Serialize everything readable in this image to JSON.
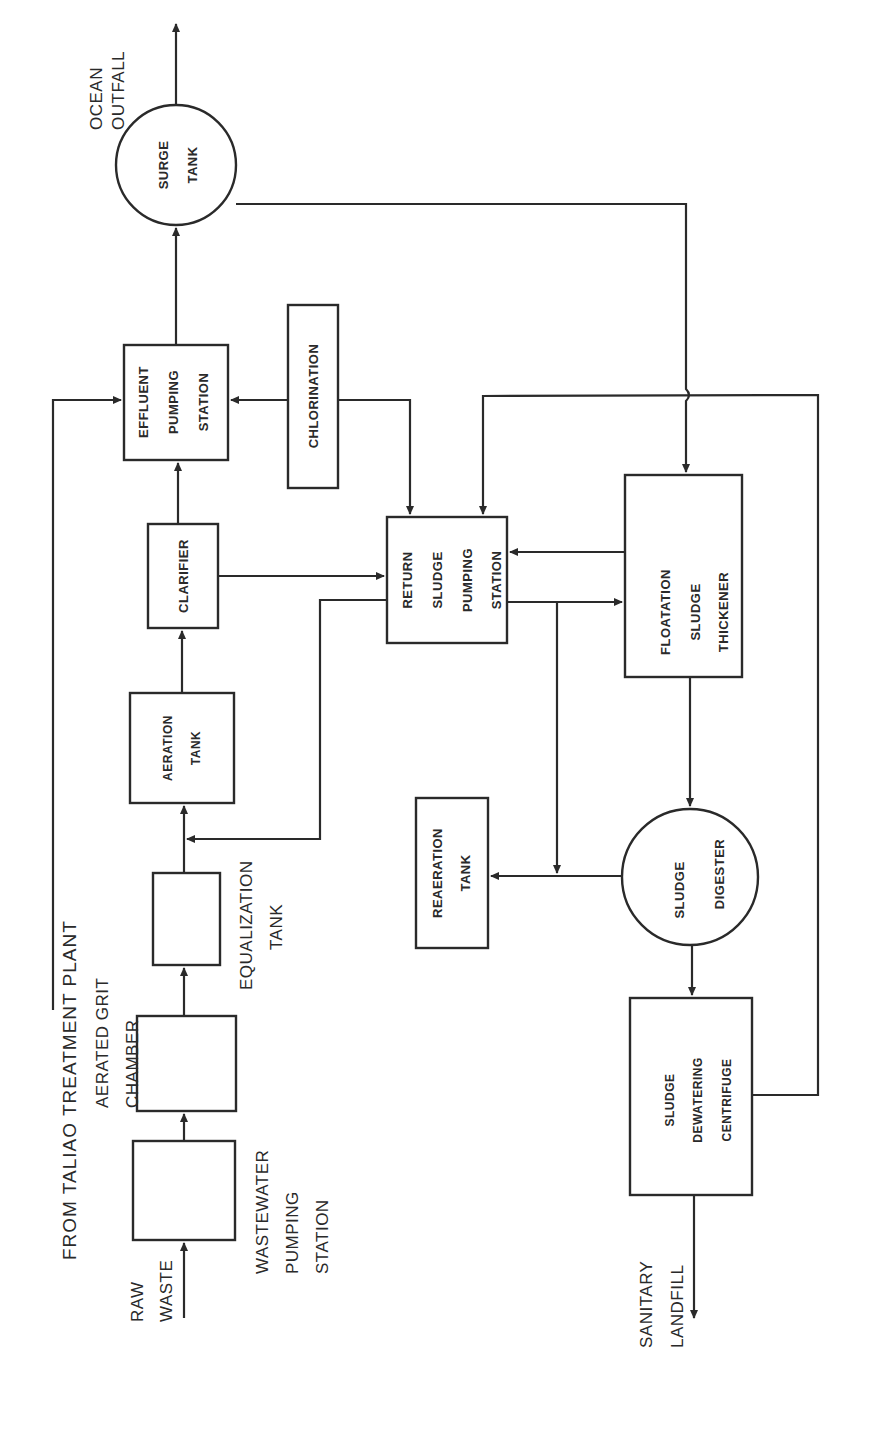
{
  "header": {
    "text": ""
  },
  "diagram": {
    "orientation": "rotated 90 degrees counter-clockwise",
    "colors": {
      "line": "#2a2a2a",
      "background": "#ffffff"
    },
    "external_labels": {
      "ocean_outfall": [
        "OCEAN",
        "OUTFALL"
      ],
      "from_taliao": "FROM TALIAO TREATMENT PLANT",
      "aerated_grit": [
        "AERATED GRIT",
        "CHAMBER"
      ],
      "equalization": [
        "EQUALIZATION",
        "TANK"
      ],
      "raw_waste": [
        "RAW",
        "WASTE"
      ],
      "ww_pumping": [
        "WASTEWATER",
        "PUMPING",
        "STATION"
      ],
      "sanitary_landfill": [
        "SANITARY",
        "LANDFILL"
      ]
    },
    "nodes": {
      "surge_tank": {
        "shape": "circle",
        "lines": [
          "SURGE",
          "TANK"
        ]
      },
      "effluent_pumping": {
        "shape": "box",
        "lines": [
          "EFFLUENT",
          "PUMPING",
          "STATION"
        ]
      },
      "chlorination": {
        "shape": "box",
        "lines": [
          "CHLORINATION"
        ]
      },
      "clarifier": {
        "shape": "box",
        "lines": [
          "CLARIFIER"
        ]
      },
      "aeration_tank": {
        "shape": "box",
        "lines": [
          "AERATION",
          "TANK"
        ]
      },
      "equalization_tank": {
        "shape": "box",
        "lines": []
      },
      "grit_chamber": {
        "shape": "box",
        "lines": []
      },
      "ww_pumping_station": {
        "shape": "box",
        "lines": []
      },
      "return_sludge": {
        "shape": "box",
        "lines": [
          "RETURN",
          "SLUDGE",
          "PUMPING",
          "STATION"
        ]
      },
      "floatation_thickener": {
        "shape": "box",
        "lines": [
          "FLOATATION",
          "SLUDGE",
          "THICKENER"
        ]
      },
      "sludge_digester": {
        "shape": "circle",
        "lines": [
          "SLUDGE",
          "DIGESTER"
        ]
      },
      "reaeration_tank": {
        "shape": "box",
        "lines": [
          "REAERATION",
          "TANK"
        ]
      },
      "dewatering_centrifuge": {
        "shape": "box",
        "lines": [
          "SLUDGE",
          "DEWATERING",
          "CENTRIFUGE"
        ]
      }
    },
    "edges": [
      {
        "from": "raw_waste",
        "to": "ww_pumping_station"
      },
      {
        "from": "ww_pumping_station",
        "to": "grit_chamber"
      },
      {
        "from": "grit_chamber",
        "to": "equalization_tank"
      },
      {
        "from": "equalization_tank",
        "to": "aeration_tank"
      },
      {
        "from": "return_sludge",
        "to": "aeration_tank"
      },
      {
        "from": "aeration_tank",
        "to": "clarifier"
      },
      {
        "from": "clarifier",
        "to": "effluent_pumping"
      },
      {
        "from": "clarifier",
        "to": "return_sludge"
      },
      {
        "from": "from_taliao",
        "to": "effluent_pumping"
      },
      {
        "from": "chlorination",
        "to": "effluent_pumping"
      },
      {
        "from": "chlorination",
        "to": "return_sludge"
      },
      {
        "from": "effluent_pumping",
        "to": "surge_tank"
      },
      {
        "from": "surge_tank",
        "to": "ocean_outfall"
      },
      {
        "from": "surge_tank",
        "to": "floatation_thickener"
      },
      {
        "from": "floatation_thickener",
        "to": "return_sludge"
      },
      {
        "from": "return_sludge",
        "to": "floatation_thickener"
      },
      {
        "from": "return_sludge",
        "to": "reaeration_tank"
      },
      {
        "from": "floatation_thickener",
        "to": "sludge_digester"
      },
      {
        "from": "sludge_digester",
        "to": "reaeration_tank"
      },
      {
        "from": "sludge_digester",
        "to": "dewatering_centrifuge"
      },
      {
        "from": "dewatering_centrifuge",
        "to": "return_sludge"
      },
      {
        "from": "dewatering_centrifuge",
        "to": "sanitary_landfill"
      }
    ]
  }
}
